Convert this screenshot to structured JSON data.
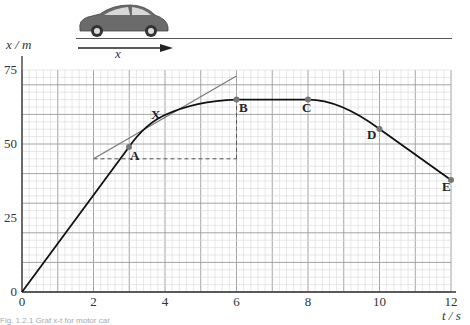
{
  "illustration": {
    "object": "car",
    "displacement_label": "x"
  },
  "chart_data": {
    "type": "line",
    "title": "",
    "xlabel": "t / s",
    "ylabel": "x / m",
    "x_ticks": [
      "0",
      "2",
      "4",
      "6",
      "8",
      "10",
      "12"
    ],
    "y_ticks": [
      "0",
      "25",
      "50",
      "75"
    ],
    "xlim": [
      0,
      12
    ],
    "ylim": [
      0,
      75
    ],
    "grid": true,
    "series": [
      {
        "name": "x-t curve",
        "x": [
          0,
          3,
          4,
          5,
          6,
          8,
          9,
          10,
          12
        ],
        "y": [
          0,
          49,
          60,
          63.5,
          65,
          65,
          61.5,
          55,
          38
        ]
      }
    ],
    "points": [
      {
        "label": "A",
        "t": 3,
        "x": 49
      },
      {
        "label": "X",
        "t": 4,
        "x": 60
      },
      {
        "label": "B",
        "t": 6,
        "x": 65
      },
      {
        "label": "C",
        "t": 8,
        "x": 65
      },
      {
        "label": "D",
        "t": 10,
        "x": 55
      },
      {
        "label": "E",
        "t": 12,
        "x": 38
      }
    ],
    "annotations": {
      "tangent_at_X": {
        "from": {
          "t": 2,
          "x": 45
        },
        "to": {
          "t": 6,
          "x": 73
        }
      },
      "dashed_horizontal": {
        "t_from": 2,
        "t_to": 6,
        "x": 45
      },
      "dashed_vertical": {
        "t": 6,
        "x_from": 45,
        "x_to": 65
      }
    }
  },
  "labels": {
    "y_axis": "x / m",
    "x_axis": "t / s",
    "A": "A",
    "X": "X",
    "B": "B",
    "C": "C",
    "D": "D",
    "E": "E",
    "caption": "Fig. 1.2.1 Graf x-t for motor car"
  }
}
